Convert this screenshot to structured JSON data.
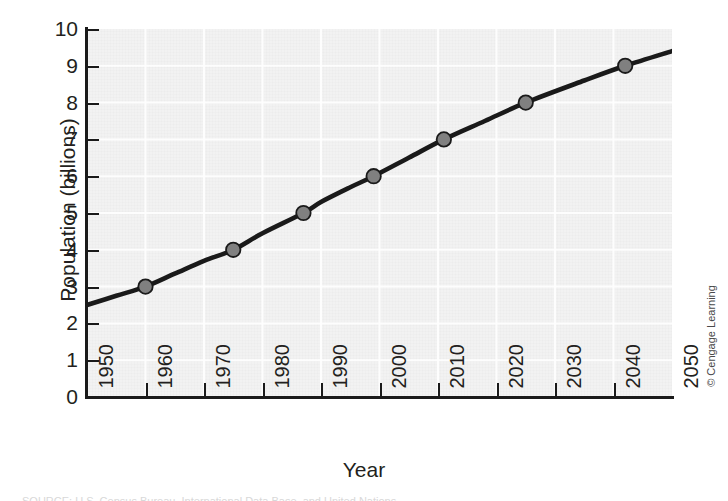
{
  "chart_data": {
    "type": "line",
    "title": "",
    "xlabel": "Year",
    "ylabel": "Population (billions)",
    "xlim": [
      1950,
      2050
    ],
    "ylim": [
      0,
      10
    ],
    "grid": true,
    "grid_color": "#ffffff",
    "plot_bg_color": "#f2f2f2",
    "line_color": "#1a1a1a",
    "marker_fill_color": "#808080",
    "marker_edge_color": "#1a1a1a",
    "legend": null,
    "xticks": [
      1950,
      1960,
      1970,
      1980,
      1990,
      2000,
      2010,
      2020,
      2030,
      2040,
      2050
    ],
    "xtick_labels": [
      "1950",
      "1960",
      "1970",
      "1980",
      "1990",
      "2000",
      "2010",
      "2020",
      "2030",
      "2040",
      "2050"
    ],
    "xtick_rotation": 90,
    "yticks": [
      0,
      1,
      2,
      3,
      4,
      5,
      6,
      7,
      8,
      9,
      10
    ],
    "ytick_labels": [
      "0",
      "1",
      "2",
      "3",
      "4",
      "5",
      "6",
      "7",
      "8",
      "9",
      "10"
    ],
    "series": [
      {
        "name": "World population",
        "x": [
          1950,
          1955,
          1960,
          1965,
          1970,
          1975,
          1980,
          1987,
          1990,
          1995,
          1999,
          2005,
          2011,
          2018,
          2025,
          2035,
          2042,
          2050
        ],
        "y": [
          2.5,
          2.75,
          3.0,
          3.35,
          3.7,
          4.0,
          4.45,
          5.0,
          5.3,
          5.7,
          6.0,
          6.5,
          7.0,
          7.5,
          8.0,
          8.6,
          9.0,
          9.4
        ]
      }
    ],
    "markers": [
      {
        "x": 1960,
        "y": 3.0,
        "label": "3 billion"
      },
      {
        "x": 1975,
        "y": 4.0,
        "label": "4 billion"
      },
      {
        "x": 1987,
        "y": 5.0,
        "label": "5 billion"
      },
      {
        "x": 1999,
        "y": 6.0,
        "label": "6 billion"
      },
      {
        "x": 2011,
        "y": 7.0,
        "label": "7 billion"
      },
      {
        "x": 2025,
        "y": 8.0,
        "label": "8 billion"
      },
      {
        "x": 2042,
        "y": 9.0,
        "label": "9 billion"
      }
    ]
  },
  "credit": {
    "text": "© Cengage Learning"
  },
  "caption": {
    "text": "SOURCE: U.S. Census Bureau, International Data Base, and United Nations"
  }
}
